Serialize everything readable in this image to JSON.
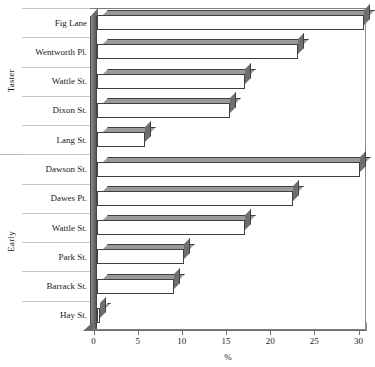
{
  "chart_data": {
    "type": "bar",
    "orientation": "horizontal",
    "title": "",
    "xlabel": "%",
    "ylabel": "",
    "xlim": [
      0,
      30
    ],
    "xticks": [
      0,
      5,
      10,
      15,
      20,
      25,
      30
    ],
    "xtick_labels": [
      "0",
      "5",
      "10",
      "15",
      "20",
      "25",
      "30"
    ],
    "grid": false,
    "legend": null,
    "groups": [
      {
        "name": "Taster",
        "categories": [
          "Fig Lane",
          "Wentworth Pl.",
          "Wattle St.",
          "Dixon St.",
          "Lang St."
        ],
        "values": [
          30.2,
          22.7,
          16.8,
          15.1,
          5.4
        ]
      },
      {
        "name": "Early",
        "categories": [
          "Dawson St.",
          "Dawes Pt.",
          "Wattle St.",
          "Park St.",
          "Barrack St.",
          "Hay St."
        ],
        "values": [
          29.8,
          22.2,
          16.8,
          9.8,
          8.7,
          0.3
        ]
      }
    ],
    "categories": [
      "Fig Lane",
      "Wentworth Pl.",
      "Wattle St.",
      "Dixon St.",
      "Lang St.",
      "Dawson St.",
      "Dawes Pt.",
      "Wattle St.",
      "Park St.",
      "Barrack St.",
      "Hay St."
    ],
    "values": [
      30.2,
      22.7,
      16.8,
      15.1,
      5.4,
      29.8,
      22.2,
      16.8,
      9.8,
      8.7,
      0.3
    ],
    "colors": {
      "bar_face": "#ffffff",
      "bar_edge": "#3f3f3f",
      "bar_top": "#9a9a9a",
      "bar_side": "#6e6e6e",
      "axis": "#6f6f6f",
      "text": "#1a1a1a"
    }
  }
}
